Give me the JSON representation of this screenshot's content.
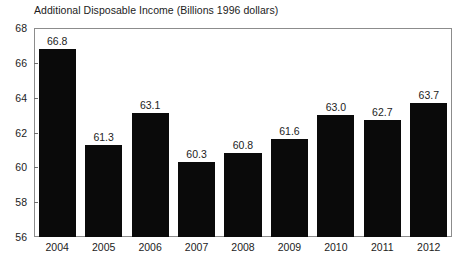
{
  "chart_data": {
    "type": "bar",
    "title": "Additional Disposable Income (Billions 1996 dollars)",
    "xlabel": "",
    "ylabel": "",
    "categories": [
      "2004",
      "2005",
      "2006",
      "2007",
      "2008",
      "2009",
      "2010",
      "2011",
      "2012"
    ],
    "values": [
      66.8,
      61.3,
      63.1,
      60.3,
      60.8,
      61.6,
      63.0,
      62.7,
      63.7
    ],
    "value_labels": [
      "66.8",
      "61.3",
      "63.1",
      "60.3",
      "60.8",
      "61.6",
      "63.0",
      "62.7",
      "63.7"
    ],
    "ylim": [
      56,
      68
    ],
    "yticks": [
      68,
      66,
      64,
      62,
      60,
      58,
      56
    ],
    "ytick_labels": [
      "68",
      "66",
      "64",
      "62",
      "60",
      "58",
      "56"
    ],
    "grid": false,
    "legend": null,
    "bar_color": "#0a0a0a",
    "background_color": "#ffffff",
    "frame_color": "#8c8c8c"
  }
}
